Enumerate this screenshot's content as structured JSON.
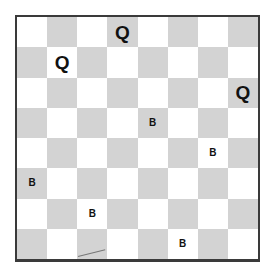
{
  "board": {
    "size": 8,
    "colors": {
      "light": "#ffffff",
      "dark": "#d3d3d3",
      "border": "#3a3a3a",
      "piece": "#111111"
    },
    "top_left_square": "light",
    "pieces": [
      {
        "row": 0,
        "col": 3,
        "label": "Q",
        "type": "queen"
      },
      {
        "row": 1,
        "col": 1,
        "label": "Q",
        "type": "queen"
      },
      {
        "row": 2,
        "col": 7,
        "label": "Q",
        "type": "queen"
      },
      {
        "row": 3,
        "col": 4,
        "label": "B",
        "type": "bishop"
      },
      {
        "row": 4,
        "col": 6,
        "label": "B",
        "type": "bishop"
      },
      {
        "row": 5,
        "col": 0,
        "label": "B",
        "type": "bishop"
      },
      {
        "row": 6,
        "col": 2,
        "label": "B",
        "type": "bishop"
      },
      {
        "row": 7,
        "col": 5,
        "label": "B",
        "type": "bishop"
      }
    ]
  }
}
